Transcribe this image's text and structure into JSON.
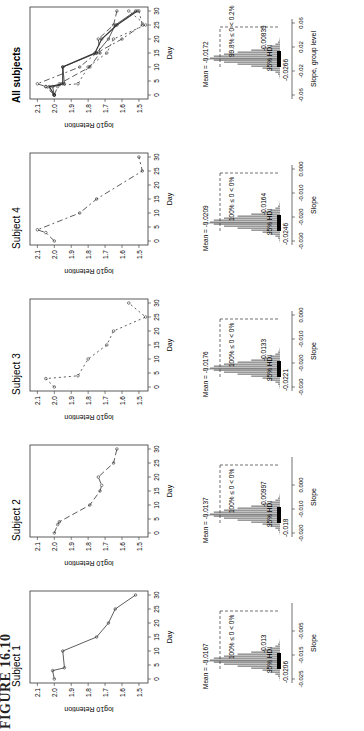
{
  "figure_label": "FIGURE 16.10",
  "chart_data": [
    {
      "type": "line",
      "title": "Subject 1",
      "xlabel": "Day",
      "ylabel": "log10 Retention",
      "xlim": [
        0,
        30
      ],
      "ylim": [
        1.45,
        2.13
      ],
      "x": [
        0,
        3,
        4,
        10,
        15,
        20,
        25,
        30
      ],
      "values": [
        2.0,
        2.01,
        1.94,
        1.95,
        1.75,
        1.68,
        1.64,
        1.52
      ],
      "line_style": "solid",
      "marker": "o"
    },
    {
      "type": "line",
      "title": "Subject 2",
      "xlabel": "Day",
      "ylabel": "log10 Retention",
      "xlim": [
        0,
        30
      ],
      "ylim": [
        1.45,
        2.13
      ],
      "x": [
        0,
        3,
        4,
        10,
        15,
        17,
        20,
        25,
        30
      ],
      "values": [
        2.0,
        1.98,
        1.97,
        1.79,
        1.73,
        1.72,
        1.74,
        1.65,
        1.63
      ],
      "line_style": "dashed",
      "marker": "triangle"
    },
    {
      "type": "line",
      "title": "Subject 3",
      "xlabel": "Day",
      "ylabel": "log10 Retention",
      "xlim": [
        0,
        30
      ],
      "ylim": [
        1.45,
        2.13
      ],
      "x": [
        0,
        3,
        4,
        10,
        15,
        20,
        25,
        30
      ],
      "values": [
        2.0,
        2.05,
        1.86,
        1.8,
        1.69,
        1.65,
        1.46,
        1.56
      ],
      "line_style": "dotted",
      "marker": "+"
    },
    {
      "type": "line",
      "title": "Subject 4",
      "xlabel": "Day",
      "ylabel": "log10 Retention",
      "xlim": [
        0,
        30
      ],
      "ylim": [
        1.45,
        2.13
      ],
      "x": [
        0,
        3,
        4,
        10,
        15,
        25,
        30
      ],
      "values": [
        2.0,
        2.05,
        2.1,
        1.85,
        1.75,
        1.48,
        1.5
      ],
      "line_style": "dashdot",
      "marker": "x"
    },
    {
      "type": "line",
      "title": "All subjects",
      "xlabel": "Day",
      "ylabel": "log10 Retention",
      "xlim": [
        0,
        30
      ],
      "ylim": [
        1.45,
        2.13
      ],
      "x": [
        0,
        3,
        4,
        10,
        15,
        20,
        25,
        30
      ],
      "series": [
        {
          "name": "Subject 1",
          "values": [
            2.0,
            2.01,
            1.94,
            1.95,
            1.75,
            1.68,
            1.64,
            1.52
          ]
        },
        {
          "name": "Subject 2",
          "values": [
            2.0,
            1.98,
            1.97,
            1.79,
            1.73,
            1.74,
            1.65,
            1.63
          ]
        },
        {
          "name": "Subject 3",
          "values": [
            2.0,
            2.05,
            1.86,
            1.8,
            1.69,
            1.65,
            1.46,
            1.56
          ]
        },
        {
          "name": "Subject 4",
          "values": [
            2.0,
            2.05,
            2.1,
            1.85,
            1.75,
            1.6,
            1.48,
            1.5
          ]
        },
        {
          "name": "Group",
          "values": [
            2.0,
            2.03,
            1.95,
            1.95,
            1.76,
            1.72,
            1.63,
            1.51
          ]
        }
      ]
    },
    {
      "type": "histogram",
      "title": "Subject 1 slope",
      "xlabel": "Slope",
      "xticks": [
        "-0.025",
        "-0.015",
        "-0.005"
      ],
      "mean": "Mean = -0.0167",
      "pct": "100% ≤ 0 < 0%",
      "hdi_label": "95% HDI",
      "hdi_low": "-0.0206",
      "hdi_high": "-0.013"
    },
    {
      "type": "histogram",
      "title": "Subject 2 slope",
      "xlabel": "Slope",
      "xticks": [
        "-0.020",
        "-0.010",
        "0.000"
      ],
      "mean": "Mean = -0.0137",
      "pct": "100% ≤ 0 < 0%",
      "hdi_label": "95% HDI",
      "hdi_low": "-0.018",
      "hdi_high": "-0.00997"
    },
    {
      "type": "histogram",
      "title": "Subject 3 slope",
      "xlabel": "Slope",
      "xticks": [
        "-0.030",
        "-0.020",
        "-0.010",
        "0.000"
      ],
      "mean": "Mean = -0.0176",
      "pct": "100% ≤ 0 < 0%",
      "hdi_label": "95% HDI",
      "hdi_low": "-0.0221",
      "hdi_high": "-0.0133"
    },
    {
      "type": "histogram",
      "title": "Subject 4 slope",
      "xlabel": "Slope",
      "xticks": [
        "-0.030",
        "-0.020",
        "-0.010",
        "0.000"
      ],
      "mean": "Mean = -0.0209",
      "pct": "100% ≤ 0 < 0%",
      "hdi_label": "95% HDI",
      "hdi_low": "-0.0246",
      "hdi_high": "-0.0164"
    },
    {
      "type": "histogram",
      "title": "Group slope",
      "xlabel": "Slope, group level",
      "xticks": [
        "-0.06",
        "-0.02",
        "0.02",
        "0.06"
      ],
      "mean": "Mean = -0.0172",
      "pct": "99.8% ≤ 0 < 0.2%",
      "hdi_label": "95% HDI",
      "hdi_low": "-0.0266",
      "hdi_high": "-0.00839"
    }
  ],
  "panels": [
    {
      "title": "Subject 1",
      "xlabel": "Day",
      "ylabel": "log10 Retention"
    },
    {
      "title": "Subject 2",
      "xlabel": "Day",
      "ylabel": "log10 Retention"
    },
    {
      "title": "Subject 3",
      "xlabel": "Day",
      "ylabel": "log10 Retention"
    },
    {
      "title": "Subject 4",
      "xlabel": "Day",
      "ylabel": "log10 Retention"
    },
    {
      "title": "All subjects",
      "xlabel": "Day",
      "ylabel": "log10 Retention"
    }
  ],
  "yticks": [
    "2.1",
    "2.0",
    "1.9",
    "1.8",
    "1.7",
    "1.6",
    "1.5"
  ],
  "xticks": [
    "0",
    "5",
    "10",
    "15",
    "20",
    "25",
    "30"
  ],
  "hists": [
    {
      "xlabel": "Slope",
      "t0": "-0.025",
      "t1": "-0.015",
      "t2": "-0.005",
      "t3": "",
      "mean": "Mean = -0.0167",
      "pct": "100% ≤ 0 < 0%",
      "hdi": "95% HDI",
      "lo": "-0.0206",
      "hi": "-0.013"
    },
    {
      "xlabel": "Slope",
      "t0": "-0.020",
      "t1": "-0.010",
      "t2": "0.000",
      "t3": "",
      "mean": "Mean = -0.0137",
      "pct": "100% ≤ 0 < 0%",
      "hdi": "95% HDI",
      "lo": "-0.018",
      "hi": "-0.00997"
    },
    {
      "xlabel": "Slope",
      "t0": "-0.030",
      "t1": "-0.020",
      "t2": "-0.010",
      "t3": "0.000",
      "mean": "Mean = -0.0176",
      "pct": "100% ≤ 0 < 0%",
      "hdi": "95% HDI",
      "lo": "-0.0221",
      "hi": "-0.0133"
    },
    {
      "xlabel": "Slope",
      "t0": "-0.030",
      "t1": "-0.020",
      "t2": "-0.010",
      "t3": "0.000",
      "mean": "Mean = -0.0209",
      "pct": "100% ≤ 0 < 0%",
      "hdi": "95% HDI",
      "lo": "-0.0246",
      "hi": "-0.0164"
    },
    {
      "xlabel": "Slope, group level",
      "t0": "-0.06",
      "t1": "-0.02",
      "t2": "0.02",
      "t3": "0.06",
      "mean": "Mean = -0.0172",
      "pct": "99.8% ≤ 0 < 0.2%",
      "hdi": "95% HDI",
      "lo": "-0.0266",
      "hi": "-0.00839"
    }
  ]
}
